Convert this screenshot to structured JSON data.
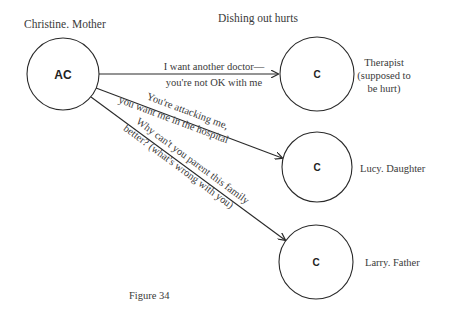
{
  "title": "Dishing out hurts",
  "caption": "Figure 34",
  "source_node": {
    "label": "Christine. Mother",
    "state": "AC"
  },
  "targets": [
    {
      "state": "C",
      "label_lines": [
        "Therapist",
        "(supposed to",
        "be hurt)"
      ],
      "message_lines": [
        "I want another doctor—",
        "you're not OK with me"
      ]
    },
    {
      "state": "C",
      "label_lines": [
        "Lucy. Daughter"
      ],
      "message_lines": [
        "You're attacking me,",
        "you want me in the hospital"
      ]
    },
    {
      "state": "C",
      "label_lines": [
        "Larry. Father"
      ],
      "message_lines": [
        "Why can't you parent this family",
        "better? (what's wrong with you)"
      ]
    }
  ],
  "colors": {
    "stroke": "#2a2a2a",
    "text": "#3a3a3a",
    "background": "#ffffff"
  }
}
